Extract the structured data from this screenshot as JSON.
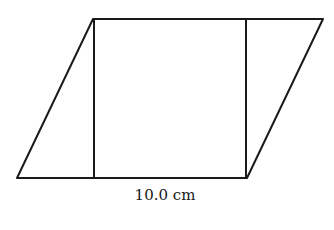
{
  "figure": {
    "base_label": "10.0 cm",
    "stroke_color": "#1a1a1a",
    "background_color": "#ffffff",
    "vertices": {
      "bottom_left": [
        17,
        178
      ],
      "bottom_right": [
        247,
        178
      ],
      "top_right": [
        323,
        19
      ],
      "top_left": [
        93,
        19
      ]
    },
    "height_lines": [
      {
        "x": 94,
        "y1": 19,
        "y2": 178
      },
      {
        "x": 246,
        "y1": 19,
        "y2": 178
      }
    ]
  }
}
